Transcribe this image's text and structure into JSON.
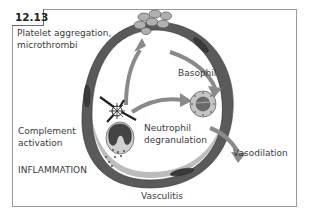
{
  "figure": {
    "number": "12.13"
  },
  "labels": {
    "platelet_line1": "Platelet aggregation,",
    "platelet_line2": "microthrombi",
    "basophil": "Basophil",
    "neutrophil_line1": "Neutrophil",
    "neutrophil_line2": "degranulation",
    "complement_line1": "Complement",
    "complement_line2": "activation",
    "inflammation": "INFLAMMATION",
    "vasodilation": "Vasodilation",
    "vasculitis": "Vasculitis"
  },
  "colors": {
    "vessel_wall": "#555555",
    "vessel_light": "#8c8c8c",
    "arrow": "#8a8a8a",
    "cell_fill": "#b8b8b8",
    "frame": "#9a9a9a"
  }
}
